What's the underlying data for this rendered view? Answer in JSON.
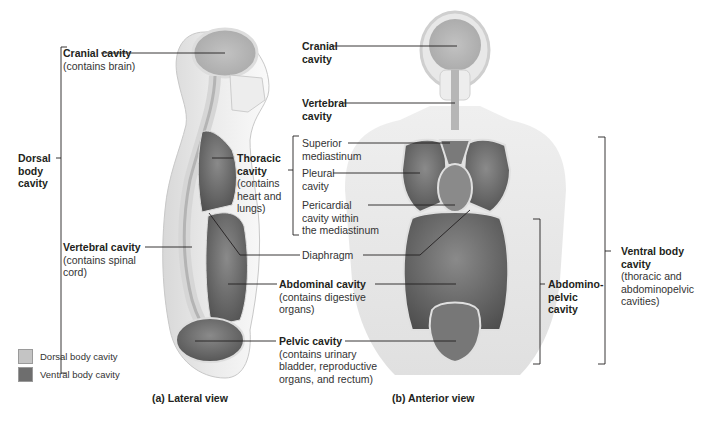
{
  "legend": {
    "items": [
      {
        "label": "Dorsal body cavity",
        "color": "#c4c4c4"
      },
      {
        "label": "Ventral body cavity",
        "color": "#6e6e6e"
      }
    ]
  },
  "lateral_view": {
    "caption": "(a) Lateral view",
    "labels": {
      "cranial": {
        "title": "Cranial cavity",
        "note": "(contains brain)"
      },
      "dorsal": {
        "line1": "Dorsal",
        "line2": "body",
        "line3": "cavity"
      },
      "vertebral": {
        "title": "Vertebral cavity",
        "note1": "(contains spinal",
        "note2": "cord)"
      },
      "thoracic": {
        "title1": "Thoracic",
        "title2": "cavity",
        "note1": "(contains",
        "note2": "heart and",
        "note3": "lungs)"
      },
      "diaphragm": "Diaphragm",
      "abdominal": {
        "title": "Abdominal cavity",
        "note1": "(contains digestive",
        "note2": "organs)"
      },
      "pelvic": {
        "title": "Pelvic cavity",
        "note1": "(contains urinary",
        "note2": "bladder, reproductive",
        "note3": "organs, and rectum)"
      }
    }
  },
  "anterior_view": {
    "caption": "(b) Anterior view",
    "labels": {
      "cranial": {
        "line1": "Cranial",
        "line2": "cavity"
      },
      "vertebral": {
        "line1": "Vertebral",
        "line2": "cavity"
      },
      "superior_mediastinum": {
        "line1": "Superior",
        "line2": "mediastinum"
      },
      "pleural": {
        "line1": "Pleural",
        "line2": "cavity"
      },
      "pericardial": {
        "line1": "Pericardial",
        "line2": "cavity within",
        "line3": "the mediastinum"
      },
      "abdominopelvic": {
        "line1": "Abdomino-",
        "line2": "pelvic",
        "line3": "cavity"
      },
      "ventral": {
        "title1": "Ventral body",
        "title2": "cavity",
        "note1": "(thoracic and",
        "note2": "abdominopelvic",
        "note3": "cavities)"
      }
    }
  },
  "colors": {
    "dorsal": "#c4c4c4",
    "ventral": "#6e6e6e",
    "body": "#e4e4e4",
    "bone": "#f2f2f2",
    "line": "#231f20"
  }
}
